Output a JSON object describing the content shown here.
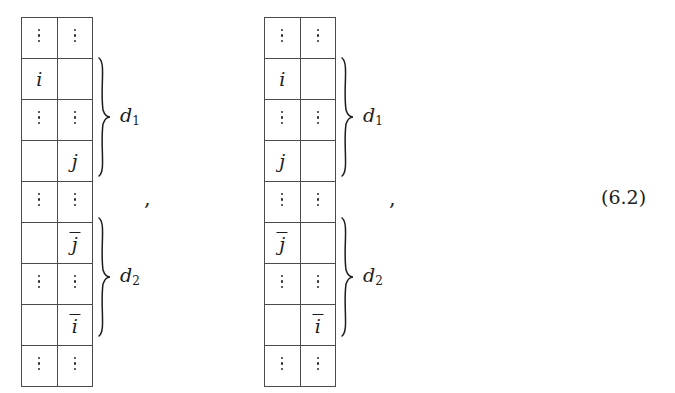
{
  "equation": {
    "number": "(6.2)",
    "separators": [
      ",",
      ","
    ]
  },
  "matrices": [
    {
      "id": "matrix-left",
      "columns": 2,
      "rows": [
        {
          "cells": [
            "vdots",
            "vdots"
          ]
        },
        {
          "cells": [
            "i",
            ""
          ]
        },
        {
          "cells": [
            "vdots",
            "vdots"
          ]
        },
        {
          "cells": [
            "",
            "j"
          ]
        },
        {
          "cells": [
            "vdots",
            "vdots"
          ]
        },
        {
          "cells": [
            "",
            "jbar"
          ]
        },
        {
          "cells": [
            "vdots",
            "vdots"
          ]
        },
        {
          "cells": [
            "",
            "ibar"
          ]
        },
        {
          "cells": [
            "vdots",
            "vdots"
          ]
        }
      ],
      "braces": [
        {
          "label": "d",
          "sub": "1",
          "from_row": 2,
          "to_row": 4
        },
        {
          "label": "d",
          "sub": "2",
          "from_row": 6,
          "to_row": 8
        }
      ]
    },
    {
      "id": "matrix-right",
      "columns": 2,
      "rows": [
        {
          "cells": [
            "vdots",
            "vdots"
          ]
        },
        {
          "cells": [
            "i",
            ""
          ]
        },
        {
          "cells": [
            "vdots",
            "vdots"
          ]
        },
        {
          "cells": [
            "j",
            ""
          ]
        },
        {
          "cells": [
            "vdots",
            "vdots"
          ]
        },
        {
          "cells": [
            "jbar",
            ""
          ]
        },
        {
          "cells": [
            "vdots",
            "vdots"
          ]
        },
        {
          "cells": [
            "",
            "ibar"
          ]
        },
        {
          "cells": [
            "vdots",
            "vdots"
          ]
        }
      ],
      "braces": [
        {
          "label": "d",
          "sub": "1",
          "from_row": 2,
          "to_row": 4
        },
        {
          "label": "d",
          "sub": "2",
          "from_row": 6,
          "to_row": 8
        }
      ]
    }
  ],
  "symbols": {
    "i": "i",
    "j": "j",
    "ibar": "i",
    "jbar": "j",
    "vdots": "",
    "d": "d"
  },
  "colors": {
    "ink": "#1c1c1c",
    "rule": "#4a4a4a",
    "background": "#ffffff"
  }
}
